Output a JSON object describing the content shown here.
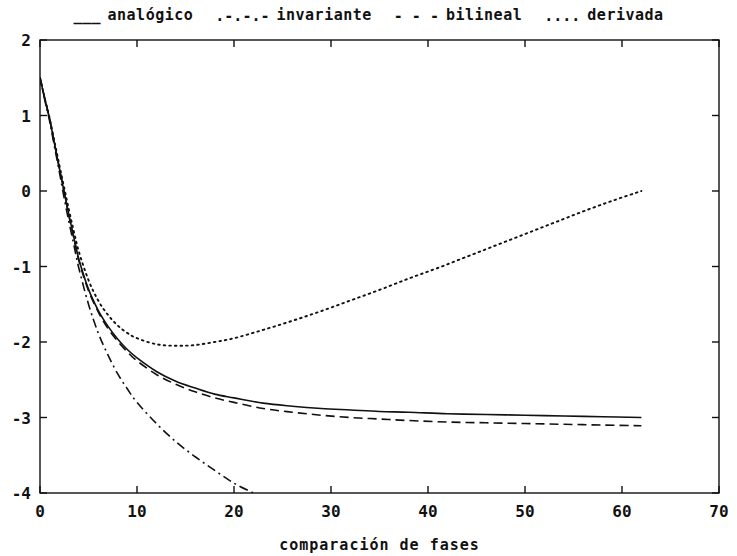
{
  "chart_data": {
    "type": "line",
    "title": "",
    "xlabel": "comparación de fases",
    "ylabel": "",
    "xlim": [
      0,
      70
    ],
    "ylim": [
      -4,
      2
    ],
    "xticks": [
      0,
      10,
      20,
      30,
      40,
      50,
      60,
      70
    ],
    "yticks": [
      2,
      1,
      0,
      -1,
      -2,
      -3,
      -4
    ],
    "grid": false,
    "legend_position": "above-top-center",
    "series": [
      {
        "name": "analógico",
        "style": "solid",
        "sample": "___",
        "x": [
          0,
          0.5,
          1,
          1.5,
          2,
          2.5,
          3,
          3.5,
          4,
          5,
          6,
          7,
          8,
          9,
          10,
          12,
          14,
          16,
          18,
          20,
          23,
          26,
          29,
          32,
          35,
          38,
          42,
          46,
          50,
          54,
          58,
          62
        ],
        "y": [
          1.5,
          1.22,
          0.95,
          0.62,
          0.3,
          -0.02,
          -0.33,
          -0.62,
          -0.9,
          -1.3,
          -1.58,
          -1.79,
          -1.96,
          -2.1,
          -2.21,
          -2.39,
          -2.52,
          -2.61,
          -2.69,
          -2.74,
          -2.81,
          -2.85,
          -2.88,
          -2.9,
          -2.92,
          -2.93,
          -2.95,
          -2.96,
          -2.97,
          -2.98,
          -2.99,
          -3.0
        ]
      },
      {
        "name": "invariante",
        "style": "dashdot",
        "sample": ".-.-.-",
        "x": [
          0,
          0.5,
          1,
          1.5,
          2,
          2.5,
          3,
          3.5,
          4,
          5,
          6,
          7,
          8,
          9,
          10,
          12,
          14,
          16,
          18,
          20,
          22
        ],
        "y": [
          1.5,
          1.2,
          0.92,
          0.58,
          0.25,
          -0.1,
          -0.42,
          -0.72,
          -1.02,
          -1.5,
          -1.88,
          -2.17,
          -2.42,
          -2.62,
          -2.8,
          -3.08,
          -3.32,
          -3.52,
          -3.7,
          -3.87,
          -4.0
        ]
      },
      {
        "name": "bilineal",
        "style": "dashed",
        "sample": "- - -",
        "x": [
          0,
          0.5,
          1,
          1.5,
          2,
          2.5,
          3,
          3.5,
          4,
          5,
          6,
          7,
          8,
          9,
          10,
          12,
          14,
          16,
          18,
          20,
          23,
          26,
          29,
          32,
          35,
          38,
          42,
          46,
          50,
          54,
          58,
          62
        ],
        "y": [
          1.5,
          1.22,
          0.95,
          0.62,
          0.3,
          -0.02,
          -0.34,
          -0.63,
          -0.92,
          -1.32,
          -1.6,
          -1.82,
          -1.99,
          -2.13,
          -2.25,
          -2.43,
          -2.56,
          -2.66,
          -2.74,
          -2.8,
          -2.88,
          -2.93,
          -2.97,
          -3.0,
          -3.02,
          -3.04,
          -3.06,
          -3.07,
          -3.08,
          -3.09,
          -3.1,
          -3.11
        ]
      },
      {
        "name": "derivada",
        "style": "dotted",
        "sample": "....",
        "x": [
          0,
          0.5,
          1,
          1.5,
          2,
          2.5,
          3,
          3.5,
          4,
          5,
          6,
          7,
          8,
          9,
          10,
          12,
          14,
          16,
          18,
          20,
          23,
          26,
          29,
          32,
          35,
          38,
          41,
          44,
          47,
          50,
          53,
          56,
          59,
          62
        ],
        "y": [
          1.5,
          1.22,
          0.96,
          0.65,
          0.34,
          0.04,
          -0.26,
          -0.54,
          -0.8,
          -1.18,
          -1.45,
          -1.64,
          -1.78,
          -1.88,
          -1.95,
          -2.03,
          -2.05,
          -2.04,
          -2.0,
          -1.95,
          -1.84,
          -1.72,
          -1.59,
          -1.45,
          -1.31,
          -1.16,
          -1.02,
          -0.87,
          -0.72,
          -0.57,
          -0.42,
          -0.27,
          -0.13,
          0.0
        ]
      }
    ]
  },
  "legend": {
    "entries": [
      {
        "sample": "___",
        "label": "analógico"
      },
      {
        "sample": ".-.-.-",
        "label": "invariante"
      },
      {
        "sample": "- - -",
        "label": "bilineal"
      },
      {
        "sample": "....",
        "label": "derivada"
      }
    ]
  },
  "axes": {
    "x_label": "comparación de fases",
    "x_tick_labels": [
      "0",
      "10",
      "20",
      "30",
      "40",
      "50",
      "60",
      "70"
    ],
    "y_tick_labels": [
      "2",
      "1",
      "0",
      "-1",
      "-2",
      "-3",
      "-4"
    ]
  },
  "colors": {
    "foreground": "#111111",
    "background": "#ffffff"
  }
}
